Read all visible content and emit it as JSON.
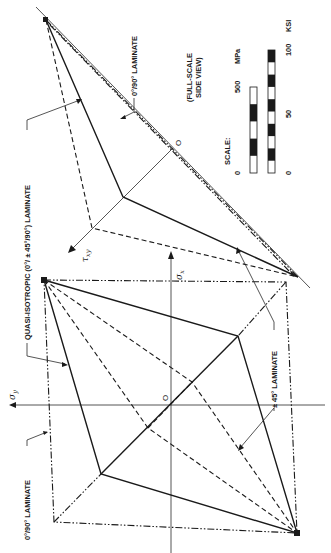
{
  "figure": {
    "orientation": "rotated-90-clockwise",
    "labels": {
      "laminate_0_90_bottom": "0°/90° LAMINATE",
      "laminate_0_90_top": "0°/90° LAMINATE",
      "quasi_isotropic": "QUASI-ISOTROPIC (0°/ ± 45°/90°) LAMINATE",
      "pm45": "± 45° LAMINATE",
      "full_scale": "(FULL-SCALE",
      "side_view": "SIDE VIEW)",
      "scale": "SCALE:"
    },
    "axes": {
      "sigma_y": "σ",
      "sigma_y_sub": "y",
      "sigma_x": "σ",
      "sigma_x_sub": "x",
      "tau_xy": "τ",
      "tau_xy_sub": "xy",
      "origin_lower": "O",
      "origin_upper": "O"
    },
    "scale_bars": {
      "mpa": {
        "unit": "MPa",
        "min_label": "0",
        "max_label": "500",
        "segments": 5
      },
      "ksi": {
        "unit": "KSI",
        "min_label": "0",
        "mid_label": "50",
        "max_label": "100",
        "segments": 10
      }
    },
    "legend_styles": {
      "quasi_isotropic": "solid",
      "pm45": "dashed",
      "laminate_0_90": "dash-dot"
    }
  }
}
